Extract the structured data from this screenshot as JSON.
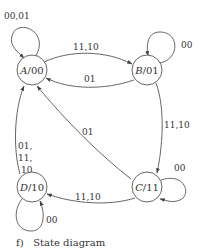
{
  "caption": "f)   State diagram",
  "colors": {
    "stroke": "#555555",
    "text": "#333333",
    "background": "#ffffff"
  },
  "states": [
    {
      "id": "A",
      "name": "A",
      "output": "/00"
    },
    {
      "id": "B",
      "name": "B",
      "output": "/01"
    },
    {
      "id": "C",
      "name": "C",
      "output": "/11"
    },
    {
      "id": "D",
      "name": "D",
      "output": "/10"
    }
  ],
  "transitions": [
    {
      "from": "A",
      "to": "A",
      "label": "00,01"
    },
    {
      "from": "A",
      "to": "B",
      "label": "11,10"
    },
    {
      "from": "B",
      "to": "A",
      "label": "01"
    },
    {
      "from": "B",
      "to": "B",
      "label": "00"
    },
    {
      "from": "B",
      "to": "C",
      "label": "11,10"
    },
    {
      "from": "C",
      "to": "A",
      "label": "01"
    },
    {
      "from": "C",
      "to": "C",
      "label": "00"
    },
    {
      "from": "C",
      "to": "D",
      "label": "11,10"
    },
    {
      "from": "D",
      "to": "A",
      "label_lines": [
        "01,",
        "11,",
        "10"
      ]
    },
    {
      "from": "D",
      "to": "D",
      "label": "00"
    }
  ]
}
